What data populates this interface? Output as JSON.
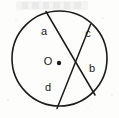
{
  "figure": {
    "type": "geometry-diagram",
    "background_color": "#fdfdfc",
    "stroke_color": "#1a1a1a",
    "stroke_width": 1.6
  },
  "circle": {
    "center_label": "O",
    "center_x": 59.5,
    "center_y": 58.5,
    "radius": 47.5,
    "center_dot": {
      "x": 59.0,
      "y": 63.0,
      "radius": 2.2
    },
    "center_label_x": 48,
    "center_label_y": 62.5
  },
  "chords": [
    {
      "name": "chord-upper-left-to-lower-right",
      "x1": 46,
      "y1": 11.5,
      "x2": 95,
      "y2": 95
    },
    {
      "name": "chord-upper-right-to-lower-left",
      "x1": 90.5,
      "y1": 24.5,
      "x2": 57,
      "y2": 108.5
    }
  ],
  "labels": [
    {
      "id": "label-a",
      "text": "a",
      "x": 44,
      "y": 32
    },
    {
      "id": "label-c",
      "text": "c",
      "x": 88,
      "y": 34
    },
    {
      "id": "label-b",
      "text": "b",
      "x": 92,
      "y": 69
    },
    {
      "id": "label-d",
      "text": "d",
      "x": 48,
      "y": 88
    }
  ],
  "artifacts": {
    "ghost_watermark": {
      "text": "",
      "x": 55,
      "y": 9,
      "visible": false
    }
  }
}
